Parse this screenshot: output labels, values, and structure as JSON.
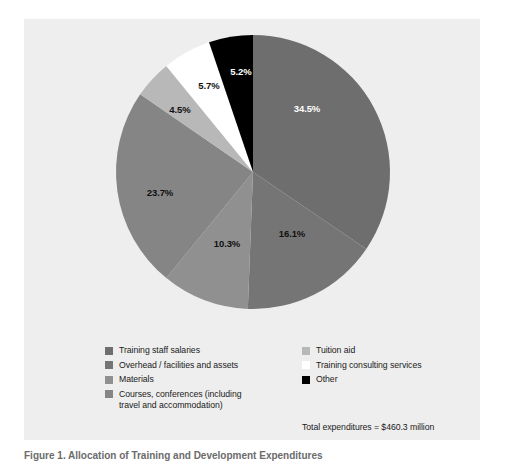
{
  "figure": {
    "caption": "Figure 1. Allocation of Training and Development Expenditures",
    "background_color": "#eeeeee",
    "page_background_color": "#ffffff"
  },
  "legend": {
    "left_column": [
      {
        "label": "Training staff salaries",
        "color": "#6e6e6e",
        "swatch_name": "legend-swatch-training-staff-salaries"
      },
      {
        "label": "Overhead / facilities and assets",
        "color": "#757575",
        "swatch_name": "legend-swatch-overhead-facilities-and-assets"
      },
      {
        "label": "Materials",
        "color": "#909090",
        "swatch_name": "legend-swatch-materials"
      },
      {
        "label": "Courses, conferences (including",
        "label_line2": "travel and accommodation)",
        "color": "#858585",
        "swatch_name": "legend-swatch-courses-conferences"
      }
    ],
    "right_column": [
      {
        "label": "Tuition aid",
        "color": "#b8b8b8",
        "swatch_name": "legend-swatch-tuition-aid"
      },
      {
        "label": "Training consulting services",
        "color": "#ffffff",
        "swatch_name": "legend-swatch-training-consulting-services"
      },
      {
        "label": "Other",
        "color": "#000000",
        "swatch_name": "legend-swatch-other"
      }
    ],
    "total_note": "Total expenditures = $460.3 million"
  },
  "chart_data": {
    "type": "pie",
    "title": "Allocation of Training and Development Expenditures",
    "subtitle": "",
    "xlabel": "",
    "ylabel": "",
    "unit": "percent",
    "total_label": "Total expenditures = $460.3 million",
    "total_value": 460.3,
    "total_unit": "$ million",
    "start_angle_deg": 0,
    "direction": "clockwise",
    "legend_position": "bottom",
    "grid": false,
    "categories": [
      "Training staff salaries",
      "Overhead / facilities and assets",
      "Materials",
      "Courses, conferences (including travel and accommodation)",
      "Tuition aid",
      "Training consulting services",
      "Other"
    ],
    "values": [
      34.5,
      16.1,
      10.3,
      23.7,
      4.5,
      5.7,
      5.2
    ],
    "value_labels": [
      "34.5%",
      "16.1%",
      "10.3%",
      "23.7%",
      "4.5%",
      "5.7%",
      "5.2%"
    ],
    "colors": [
      "#6e6e6e",
      "#757575",
      "#909090",
      "#858585",
      "#b8b8b8",
      "#ffffff",
      "#000000"
    ],
    "label_text_colors": [
      "#ffffff",
      "#111111",
      "#111111",
      "#111111",
      "#111111",
      "#111111",
      "#ffffff"
    ],
    "slices": [
      {
        "name": "Training staff salaries",
        "value": 34.5,
        "label": "34.5%",
        "color": "#6e6e6e",
        "label_color": "#ffffff",
        "label_x": 307,
        "label_y": 112
      },
      {
        "name": "Overhead / facilities and assets",
        "value": 16.1,
        "label": "16.1%",
        "color": "#757575",
        "label_color": "#111111",
        "label_x": 292,
        "label_y": 237
      },
      {
        "name": "Materials",
        "value": 10.3,
        "label": "10.3%",
        "color": "#909090",
        "label_color": "#111111",
        "label_x": 227,
        "label_y": 247
      },
      {
        "name": "Courses, conferences (including travel and accommodation)",
        "value": 23.7,
        "label": "23.7%",
        "color": "#858585",
        "label_color": "#111111",
        "label_x": 160,
        "label_y": 196
      },
      {
        "name": "Tuition aid",
        "value": 4.5,
        "label": "4.5%",
        "color": "#b8b8b8",
        "label_color": "#111111",
        "label_x": 180,
        "label_y": 113
      },
      {
        "name": "Training consulting services",
        "value": 5.7,
        "label": "5.7%",
        "color": "#ffffff",
        "label_color": "#111111",
        "label_x": 209,
        "label_y": 89
      },
      {
        "name": "Other",
        "value": 5.2,
        "label": "5.2%",
        "color": "#000000",
        "label_color": "#ffffff",
        "label_x": 241,
        "label_y": 75
      }
    ]
  }
}
